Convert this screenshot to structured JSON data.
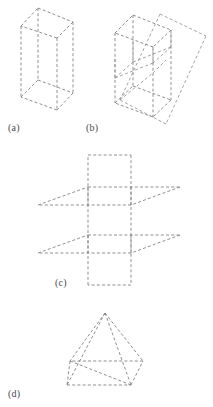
{
  "figure": {
    "page_background": "#ffffff",
    "line_color": "#7b7b7b",
    "line_style": "dashed",
    "panels": [
      {
        "id": "a",
        "caption": "(a)",
        "shape": "cube-wireframe",
        "description": "Wireframe cube drawn entirely in dashed lines, oblique projection"
      },
      {
        "id": "b",
        "caption": "(b)",
        "shape": "cube-with-intersecting-plane",
        "description": "Wireframe cube intersected by a slanted parallelogram plane, all dashed"
      },
      {
        "id": "c",
        "caption": "(c)",
        "shape": "three-intersecting-planes",
        "description": "Two horizontal parallelogram planes pierced by one vertical parallelogram plane, all dashed"
      },
      {
        "id": "d",
        "caption": "(d)",
        "shape": "square-pyramid",
        "description": "Square-base pyramid wireframe with hidden base edges, all dashed"
      }
    ]
  },
  "captions": {
    "a": "(a)",
    "b": "(b)",
    "c": "(c)",
    "d": "(d)"
  }
}
